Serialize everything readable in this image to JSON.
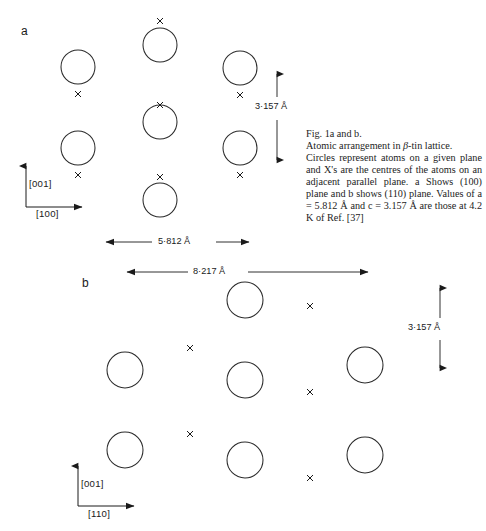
{
  "figure": {
    "panels": [
      {
        "letter": "a",
        "plane": "(100)",
        "dimension_horizontal": "5·812 Å",
        "dimension_vertical": "3·157 Å",
        "axis_vertical": "[001]",
        "axis_horizontal": "[100]",
        "circles": [
          {
            "cx": 78,
            "cy": 67,
            "r": 17
          },
          {
            "cx": 160,
            "cy": 45,
            "r": 17
          },
          {
            "cx": 240,
            "cy": 68,
            "r": 17
          },
          {
            "cx": 160,
            "cy": 122,
            "r": 17
          },
          {
            "cx": 78,
            "cy": 148,
            "r": 17
          },
          {
            "cx": 240,
            "cy": 148,
            "r": 17
          },
          {
            "cx": 160,
            "cy": 200,
            "r": 17
          }
        ],
        "crosses": [
          {
            "x": 160,
            "y": 21
          },
          {
            "x": 78,
            "y": 94
          },
          {
            "x": 240,
            "y": 95
          },
          {
            "x": 160,
            "y": 105
          },
          {
            "x": 78,
            "y": 175
          },
          {
            "x": 240,
            "y": 175
          },
          {
            "x": 160,
            "y": 177
          }
        ]
      },
      {
        "letter": "b",
        "plane": "(110)",
        "dimension_horizontal": "8·217 Å",
        "dimension_vertical": "3·157 Å",
        "axis_vertical": "[001]",
        "axis_horizontal": "[110]",
        "circles": [
          {
            "cx": 245,
            "cy": 300,
            "r": 18
          },
          {
            "cx": 125,
            "cy": 370,
            "r": 18
          },
          {
            "cx": 245,
            "cy": 380,
            "r": 18
          },
          {
            "cx": 125,
            "cy": 450,
            "r": 18
          },
          {
            "cx": 245,
            "cy": 460,
            "r": 18
          },
          {
            "cx": 365,
            "cy": 365,
            "r": 18
          },
          {
            "cx": 365,
            "cy": 455,
            "r": 18
          }
        ],
        "crosses": [
          {
            "x": 310,
            "y": 306
          },
          {
            "x": 190,
            "y": 348
          },
          {
            "x": 310,
            "y": 392
          },
          {
            "x": 190,
            "y": 434
          },
          {
            "x": 310,
            "y": 478
          }
        ]
      }
    ]
  },
  "caption": {
    "line1": "Fig. 1a and b.",
    "line2_pre": "Atomic arrangement in ",
    "line2_beta": "β",
    "line2_post": "-tin lattice.",
    "body": "Circles represent atoms on a given plane and X's are the centres of the atoms on an adjacent parallel plane. a Shows (100) plane and b shows (110) plane. Values of a = 5.812 Å and c = 3.157 Å are those at 4.2 K of Ref. [37]"
  },
  "style": {
    "stroke": "#1a1a1a",
    "background": "#ffffff"
  }
}
